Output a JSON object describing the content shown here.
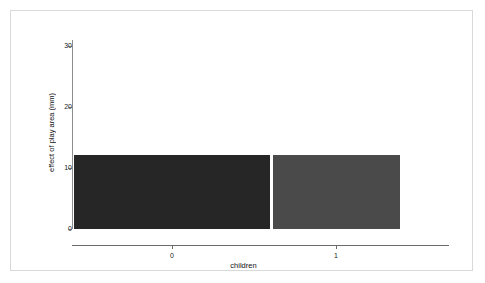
{
  "chart_data": {
    "type": "bar",
    "title": "",
    "subtitle": "",
    "xlabel": "children",
    "ylabel": "effect of play area (mm)",
    "categories": [
      "0",
      "1"
    ],
    "values": [
      12.2,
      12.2
    ],
    "series": [
      {
        "name": "effect of play area",
        "values": [
          12.2,
          12.2
        ]
      }
    ],
    "yticks": [
      0,
      10,
      20,
      30
    ],
    "ytick_labels": [
      "0",
      "10",
      "20",
      "30"
    ],
    "xtick_labels": [
      "0",
      "1"
    ],
    "ylim": [
      0,
      32
    ],
    "grid": false,
    "legend": "none",
    "bar_colors": [
      "#262626",
      "#4a4a4a"
    ],
    "axis_color": "#6b6b6b",
    "background_color": "#ffffff",
    "frame_color": "#d9d9d9"
  },
  "axis": {
    "y_title": "effect of play area (mm)",
    "x_title": "children"
  }
}
